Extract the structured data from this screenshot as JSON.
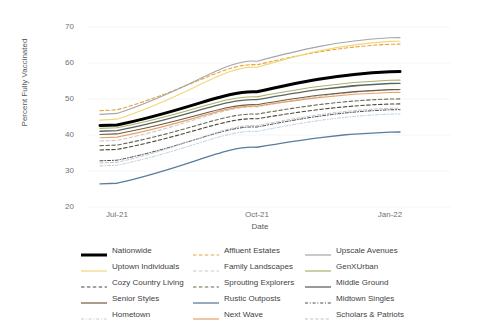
{
  "chart_data": {
    "type": "line",
    "title": "",
    "xlabel": "Date",
    "ylabel": "Percent Fully Vaccinated",
    "x": [
      "Jul-21",
      "Oct-21",
      "Jan-22"
    ],
    "xtick_labels": [
      "Jul-21",
      "Oct-21",
      "Jan-22"
    ],
    "ytick_labels": [
      "20",
      "30",
      "40",
      "50",
      "60",
      "70"
    ],
    "yticks": [
      20,
      30,
      40,
      50,
      60,
      70
    ],
    "ylim": [
      20,
      72
    ],
    "grid": "horizontal",
    "legend_position": "bottom",
    "legend_columns": 3,
    "series": [
      {
        "name": "Nationwide",
        "color": "#000000",
        "width": 3.0,
        "dash": "solid",
        "values": [
          42.8,
          52.0,
          57.6
        ]
      },
      {
        "name": "Affluent Estates",
        "color": "#E8A33D",
        "width": 1.1,
        "dash": "dashed",
        "values": [
          47.0,
          59.5,
          65.2
        ]
      },
      {
        "name": "Upscale Avenues",
        "color": "#A6A6A6",
        "width": 1.1,
        "dash": "solid",
        "values": [
          46.0,
          60.5,
          67.0
        ]
      },
      {
        "name": "Uptown Individuals",
        "color": "#F2D779",
        "width": 1.1,
        "dash": "solid",
        "values": [
          44.4,
          58.8,
          66.0
        ]
      },
      {
        "name": "Family Landscapes",
        "color": "#C9C9C9",
        "width": 1.1,
        "dash": "dashed",
        "values": [
          38.5,
          47.8,
          52.5
        ]
      },
      {
        "name": "GenXUrban",
        "color": "#A8B36A",
        "width": 1.1,
        "dash": "solid",
        "values": [
          42.0,
          50.6,
          55.2
        ]
      },
      {
        "name": "Cozy Country Living",
        "color": "#4A4A3A",
        "width": 1.1,
        "dash": "dashed",
        "values": [
          36.0,
          44.5,
          48.6
        ]
      },
      {
        "name": "Sprouting Explorers",
        "color": "#6B6B4F",
        "width": 1.1,
        "dash": "dashed",
        "values": [
          37.2,
          45.8,
          50.0
        ]
      },
      {
        "name": "Middle Ground",
        "color": "#5C6660",
        "width": 1.3,
        "dash": "solid",
        "values": [
          41.2,
          49.8,
          54.3
        ]
      },
      {
        "name": "Senior Styles",
        "color": "#6E5C3E",
        "width": 1.1,
        "dash": "solid",
        "values": [
          40.3,
          48.4,
          52.6
        ]
      },
      {
        "name": "Rustic Outposts",
        "color": "#5B7C9D",
        "width": 1.3,
        "dash": "solid",
        "values": [
          26.6,
          36.6,
          40.8
        ]
      },
      {
        "name": "Midtown Singles",
        "color": "#4A4A4A",
        "width": 1.0,
        "dash": "dashdot",
        "values": [
          33.0,
          42.2,
          47.0
        ]
      },
      {
        "name": "Hometown",
        "color": "#BBD0E0",
        "width": 1.0,
        "dash": "dashdot",
        "values": [
          31.6,
          41.0,
          45.8
        ]
      },
      {
        "name": "Next Wave",
        "color": "#E8A06A",
        "width": 1.1,
        "dash": "solid",
        "values": [
          39.4,
          48.0,
          51.8
        ]
      },
      {
        "name": "Scholars & Patriots",
        "color": "#C2C2C2",
        "width": 1.0,
        "dash": "dashed",
        "values": [
          32.4,
          42.6,
          47.4
        ]
      }
    ]
  },
  "legend": {
    "items": [
      {
        "label": "Nationwide"
      },
      {
        "label": "Affluent Estates"
      },
      {
        "label": "Upscale Avenues"
      },
      {
        "label": "Uptown Individuals"
      },
      {
        "label": "Family Landscapes"
      },
      {
        "label": "GenXUrban"
      },
      {
        "label": "Cozy Country Living"
      },
      {
        "label": "Sprouting Explorers"
      },
      {
        "label": "Middle Ground"
      },
      {
        "label": "Senior Styles"
      },
      {
        "label": "Rustic Outposts"
      },
      {
        "label": "Midtown Singles"
      },
      {
        "label": "Hometown"
      },
      {
        "label": "Next Wave"
      },
      {
        "label": "Scholars & Patriots"
      }
    ]
  }
}
